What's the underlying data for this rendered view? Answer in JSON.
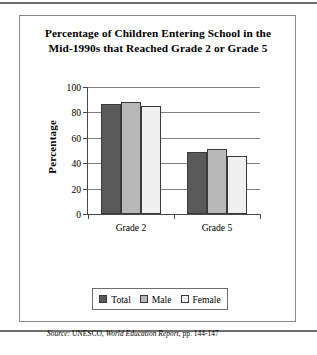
{
  "figure": {
    "title_line1": "Percentage of Children Entering School in the",
    "title_line2": "Mid-1990s that Reached Grade 2 or Grade 5",
    "source_prefix": "Source:",
    "source_org": "UNESCO,",
    "source_publication": "World Education Report",
    "source_pages": ", pp. 144-147"
  },
  "colors": {
    "total": "#595959",
    "male": "#b8b8b8",
    "female": "#f0f0f0",
    "axis": "#4a4a4a",
    "grid": "#808080",
    "frame": "#8a8a8a"
  },
  "chart_data": {
    "type": "bar",
    "title": "Percentage of Children Entering School in the Mid-1990s that Reached Grade 2 or Grade 5",
    "xlabel": "",
    "ylabel": "Percentage",
    "ylim": [
      0,
      100
    ],
    "yticks": [
      0,
      20,
      40,
      60,
      80,
      100
    ],
    "categories": [
      "Grade 2",
      "Grade 5"
    ],
    "grid": true,
    "legend_position": "bottom",
    "series": [
      {
        "name": "Total",
        "values": [
          87,
          49
        ],
        "color": "#595959"
      },
      {
        "name": "Male",
        "values": [
          88,
          51
        ],
        "color": "#b8b8b8"
      },
      {
        "name": "Female",
        "values": [
          85,
          46
        ],
        "color": "#f0f0f0"
      }
    ]
  }
}
